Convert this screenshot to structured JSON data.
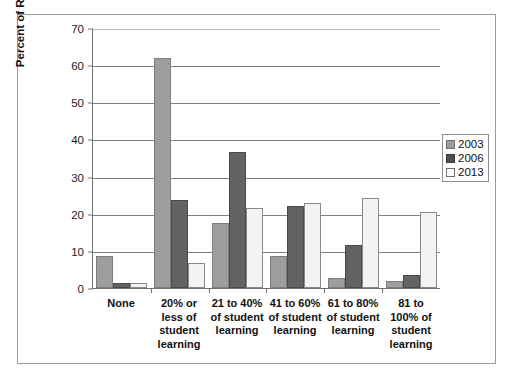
{
  "chart_data": {
    "type": "bar",
    "title": "",
    "subtitle": "",
    "xlabel": "",
    "ylabel": "Percent of Respondents",
    "ylim": [
      0,
      70
    ],
    "ytick_step": 10,
    "yticks": [
      "0",
      "10",
      "20",
      "30",
      "40",
      "50",
      "60",
      "70"
    ],
    "grid": true,
    "grid_axis": "y",
    "legend_position": "right",
    "categories": [
      "None",
      "20% or less of student learning",
      "21 to 40% of student learning",
      "41 to 60% of student learning",
      "61 to 80% of student learning",
      "81 to 100% of student learning"
    ],
    "series": [
      {
        "name": "2003",
        "color": "#9e9e9e",
        "values": [
          8.6,
          62.0,
          17.5,
          8.5,
          2.7,
          2.0
        ]
      },
      {
        "name": "2006",
        "color": "#636363",
        "values": [
          1.3,
          23.8,
          36.7,
          22.1,
          11.5,
          3.5
        ]
      },
      {
        "name": "2013",
        "color": "#f3f3f3",
        "values": [
          1.3,
          6.7,
          21.6,
          23.0,
          24.3,
          20.5
        ]
      }
    ]
  },
  "axis": {
    "y_title": "Percent of Respondents",
    "ticks": [
      {
        "label": "70",
        "value": 70
      },
      {
        "label": "60",
        "value": 60
      },
      {
        "label": "50",
        "value": 50
      },
      {
        "label": "40",
        "value": 40
      },
      {
        "label": "30",
        "value": 30
      },
      {
        "label": "20",
        "value": 20
      },
      {
        "label": "10",
        "value": 10
      },
      {
        "label": "0",
        "value": 0
      }
    ]
  },
  "xlabels": [
    {
      "line1": "None",
      "line2": "",
      "line3": "",
      "line4": ""
    },
    {
      "line1": "20% or",
      "line2": "less of",
      "line3": "student",
      "line4": "learning"
    },
    {
      "line1": "21 to 40%",
      "line2": "of student",
      "line3": "learning",
      "line4": ""
    },
    {
      "line1": "41 to 60%",
      "line2": "of student",
      "line3": "learning",
      "line4": ""
    },
    {
      "line1": "61 to 80%",
      "line2": "of student",
      "line3": "learning",
      "line4": ""
    },
    {
      "line1": "81 to",
      "line2": "100% of",
      "line3": "student",
      "line4": "learning"
    }
  ],
  "legend": {
    "items": [
      {
        "label": "2003",
        "swatch": "light-gray-swatch"
      },
      {
        "label": "2006",
        "swatch": "dark-gray-swatch"
      },
      {
        "label": "2013",
        "swatch": "white-swatch"
      }
    ]
  }
}
